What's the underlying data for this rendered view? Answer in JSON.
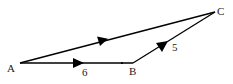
{
  "diagram": {
    "type": "vector-triangle",
    "points": {
      "A": {
        "label": "A",
        "x": 20,
        "y": 63
      },
      "B": {
        "label": "B",
        "x": 133,
        "y": 63
      },
      "C": {
        "label": "C",
        "x": 215,
        "y": 12
      }
    },
    "edges": [
      {
        "from": "A",
        "to": "B",
        "label": "6",
        "arrow": true
      },
      {
        "from": "B",
        "to": "C",
        "label": "5",
        "arrow": true
      },
      {
        "from": "A",
        "to": "C",
        "label": "",
        "arrow": true
      }
    ],
    "labels": {
      "A": "A",
      "B": "B",
      "C": "C",
      "AB": "6",
      "BC": "5"
    },
    "colors": {
      "line": "#000000",
      "text": "#222222",
      "background": "#ffffff"
    }
  }
}
